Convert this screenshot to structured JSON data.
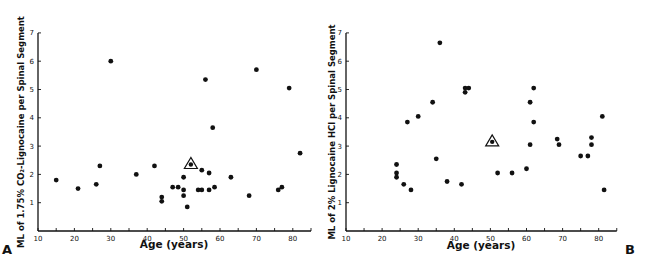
{
  "chart_data": [
    {
      "type": "scatter",
      "panel_label": "A",
      "title": "",
      "xlabel": "Age (years)",
      "ylabel": "ML of 1.75% CO2-Lignocaine per Spinal Segment",
      "xlim": [
        10,
        85
      ],
      "ylim": [
        0,
        7
      ],
      "xticks": [
        10,
        20,
        30,
        40,
        50,
        60,
        70,
        80
      ],
      "yticks": [
        1,
        2,
        3,
        4,
        5,
        6,
        7
      ],
      "grid": false,
      "points": [
        {
          "x": 15,
          "y": 1.8
        },
        {
          "x": 21,
          "y": 1.5
        },
        {
          "x": 26,
          "y": 1.65
        },
        {
          "x": 27,
          "y": 2.3
        },
        {
          "x": 30,
          "y": 6.0
        },
        {
          "x": 37,
          "y": 2.0
        },
        {
          "x": 42,
          "y": 2.3
        },
        {
          "x": 44,
          "y": 1.2
        },
        {
          "x": 44,
          "y": 1.05
        },
        {
          "x": 47,
          "y": 1.55
        },
        {
          "x": 48.5,
          "y": 1.55
        },
        {
          "x": 50,
          "y": 1.9
        },
        {
          "x": 50,
          "y": 1.45
        },
        {
          "x": 50,
          "y": 1.25
        },
        {
          "x": 51,
          "y": 0.85
        },
        {
          "x": 54,
          "y": 1.45
        },
        {
          "x": 55,
          "y": 1.45
        },
        {
          "x": 55,
          "y": 2.15
        },
        {
          "x": 56,
          "y": 5.35
        },
        {
          "x": 57,
          "y": 2.05
        },
        {
          "x": 57,
          "y": 1.45
        },
        {
          "x": 58,
          "y": 3.65
        },
        {
          "x": 58.5,
          "y": 1.55
        },
        {
          "x": 63,
          "y": 1.9
        },
        {
          "x": 68,
          "y": 1.25
        },
        {
          "x": 70,
          "y": 5.7
        },
        {
          "x": 76,
          "y": 1.45
        },
        {
          "x": 77,
          "y": 1.55
        },
        {
          "x": 79,
          "y": 5.05
        },
        {
          "x": 82,
          "y": 2.75
        }
      ],
      "mean_marker": {
        "x": 52,
        "y": 2.35,
        "symbol": "triangle-with-dot"
      }
    },
    {
      "type": "scatter",
      "panel_label": "B",
      "title": "",
      "xlabel": "Age (years)",
      "ylabel": "ML of 2% Lignocaine HCl per Spinal Segment",
      "xlim": [
        10,
        85
      ],
      "ylim": [
        0,
        7
      ],
      "xticks": [
        10,
        20,
        30,
        40,
        50,
        60,
        70,
        80
      ],
      "yticks": [
        1,
        2,
        3,
        4,
        5,
        6,
        7
      ],
      "grid": false,
      "points": [
        {
          "x": 24,
          "y": 2.35
        },
        {
          "x": 24,
          "y": 2.05
        },
        {
          "x": 24,
          "y": 1.9
        },
        {
          "x": 26,
          "y": 1.65
        },
        {
          "x": 27,
          "y": 3.85
        },
        {
          "x": 28,
          "y": 1.45
        },
        {
          "x": 30,
          "y": 4.05
        },
        {
          "x": 34,
          "y": 4.55
        },
        {
          "x": 35,
          "y": 2.55
        },
        {
          "x": 36,
          "y": 6.65
        },
        {
          "x": 38,
          "y": 1.75
        },
        {
          "x": 42,
          "y": 1.65
        },
        {
          "x": 43,
          "y": 5.05
        },
        {
          "x": 43,
          "y": 4.9
        },
        {
          "x": 44,
          "y": 5.05
        },
        {
          "x": 52,
          "y": 2.05
        },
        {
          "x": 56,
          "y": 2.05
        },
        {
          "x": 60,
          "y": 2.2
        },
        {
          "x": 61,
          "y": 4.55
        },
        {
          "x": 61,
          "y": 3.05
        },
        {
          "x": 62,
          "y": 5.05
        },
        {
          "x": 62,
          "y": 3.85
        },
        {
          "x": 68.5,
          "y": 3.25
        },
        {
          "x": 69,
          "y": 3.05
        },
        {
          "x": 75,
          "y": 2.65
        },
        {
          "x": 77,
          "y": 2.65
        },
        {
          "x": 78,
          "y": 3.3
        },
        {
          "x": 78,
          "y": 3.05
        },
        {
          "x": 81,
          "y": 4.05
        },
        {
          "x": 81.5,
          "y": 1.45
        }
      ],
      "mean_marker": {
        "x": 50.5,
        "y": 3.15,
        "symbol": "triangle-with-dot"
      }
    }
  ],
  "panels": {
    "a": {
      "letter": "A",
      "xlabel": "Age (years)",
      "ylabel": "ML of 1.75% CO₂-Lignocaine per Spinal Segment"
    },
    "b": {
      "letter": "B",
      "xlabel": "Age (years)",
      "ylabel": "ML of 2% Lignocaine HCl per Spinal Segment"
    }
  },
  "colors": {
    "ink": "#111111",
    "background": "#ffffff"
  }
}
